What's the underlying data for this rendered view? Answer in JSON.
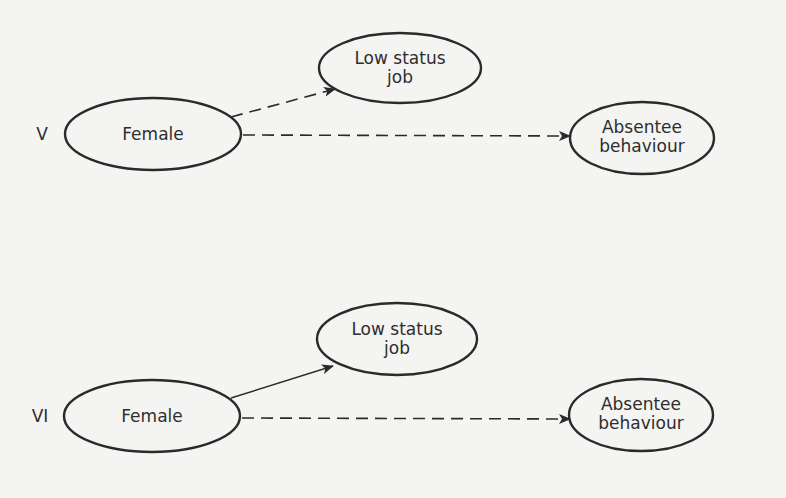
{
  "panels": [
    {
      "id": "V",
      "label": "V",
      "nodes": {
        "female": "Female",
        "low_status_job": [
          "Low status",
          "job"
        ],
        "absentee": [
          "Absentee",
          "behaviour"
        ]
      },
      "edges": [
        {
          "from": "Female",
          "to": "Low status job",
          "style": "dashed"
        },
        {
          "from": "Female",
          "to": "Absentee behaviour",
          "style": "dashed"
        }
      ]
    },
    {
      "id": "VI",
      "label": "VI",
      "nodes": {
        "female": "Female",
        "low_status_job": [
          "Low status",
          "job"
        ],
        "absentee": [
          "Absentee",
          "behaviour"
        ]
      },
      "edges": [
        {
          "from": "Female",
          "to": "Low status job",
          "style": "solid"
        },
        {
          "from": "Female",
          "to": "Absentee behaviour",
          "style": "dashed"
        }
      ]
    }
  ],
  "colors": {
    "background": "#f4f4f2",
    "stroke": "#2a2a2a"
  }
}
